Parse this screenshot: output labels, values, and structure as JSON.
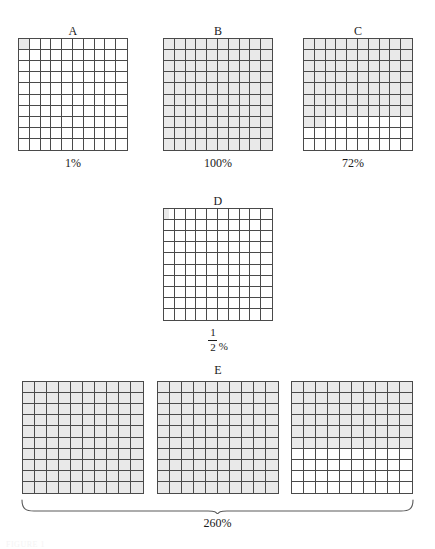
{
  "figure": {
    "title": "",
    "background_color": "#ffffff",
    "shade_color": "#e9e9e9",
    "line_color": "#4a4a4a",
    "text_color": "#1a1a1a",
    "bottom_scrap_text": "FIGURE 1"
  },
  "chart_data": {
    "type": "table",
    "xlabel": "",
    "ylabel": "",
    "grid": true,
    "legend": "none",
    "grid_rows": 10,
    "grid_cols": 10,
    "cells_per_grid": 100,
    "categories": [
      "A",
      "B",
      "C",
      "D",
      "E"
    ],
    "values": [
      1,
      100,
      72,
      0.5,
      260
    ],
    "value_labels": [
      "1%",
      "100%",
      "72%",
      "1/2 %",
      "260%"
    ],
    "items": [
      {
        "label": "A",
        "value": 1,
        "value_label": "1%",
        "value_label_kind": "plain",
        "grids": 1,
        "shaded_cells_total": 1,
        "grid_fills": [
          {
            "full_rows": 0,
            "partial_row_cells": 1,
            "half_cell": false
          }
        ]
      },
      {
        "label": "B",
        "value": 100,
        "value_label": "100%",
        "value_label_kind": "plain",
        "grids": 1,
        "shaded_cells_total": 100,
        "grid_fills": [
          {
            "full_rows": 10,
            "partial_row_cells": 0,
            "half_cell": false
          }
        ]
      },
      {
        "label": "C",
        "value": 72,
        "value_label": "72%",
        "value_label_kind": "plain",
        "grids": 1,
        "shaded_cells_total": 72,
        "grid_fills": [
          {
            "full_rows": 7,
            "partial_row_cells": 2,
            "half_cell": false
          }
        ]
      },
      {
        "label": "D",
        "value": 0.5,
        "value_label_kind": "fraction",
        "fraction_numerator": "1",
        "fraction_denominator": "2",
        "fraction_suffix": "%",
        "grids": 1,
        "shaded_cells_total": 0.5,
        "grid_fills": [
          {
            "full_rows": 0,
            "partial_row_cells": 0,
            "half_cell": true
          }
        ]
      },
      {
        "label": "E",
        "value": 260,
        "value_label": "260%",
        "value_label_kind": "braced",
        "grids": 3,
        "shaded_cells_total": 260,
        "grid_fills": [
          {
            "full_rows": 10,
            "partial_row_cells": 0,
            "half_cell": false
          },
          {
            "full_rows": 10,
            "partial_row_cells": 0,
            "half_cell": false
          },
          {
            "full_rows": 6,
            "partial_row_cells": 0,
            "half_cell": false
          }
        ]
      }
    ]
  }
}
